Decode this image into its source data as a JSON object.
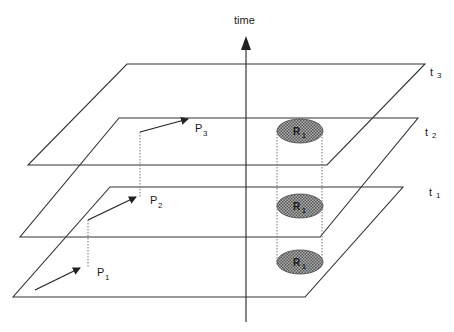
{
  "axis": {
    "label": "time"
  },
  "planes": [
    {
      "id": "t1",
      "label": "t",
      "sub": "1"
    },
    {
      "id": "t2",
      "label": "t",
      "sub": "2"
    },
    {
      "id": "t3",
      "label": "t",
      "sub": "3"
    }
  ],
  "points": [
    {
      "id": "P1",
      "label": "P",
      "sub": "1"
    },
    {
      "id": "P2",
      "label": "P",
      "sub": "2"
    },
    {
      "id": "P3",
      "label": "P",
      "sub": "3"
    }
  ],
  "region": {
    "label": "R",
    "sub": "1"
  },
  "colors": {
    "line": "#333333",
    "region_fill": "#8a8a8a",
    "dotted": "#777777"
  }
}
